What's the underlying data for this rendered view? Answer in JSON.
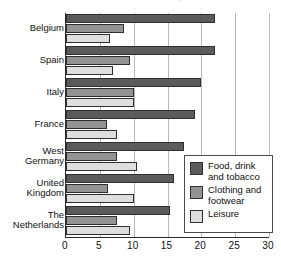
{
  "chart_data": {
    "type": "bar",
    "orientation": "horizontal",
    "title": "% of household budget",
    "xlabel": "",
    "ylabel": "",
    "xlim": [
      0,
      30
    ],
    "xticks": [
      "0",
      "5",
      "10",
      "15",
      "20",
      "25",
      "30"
    ],
    "grid": true,
    "legend_position": "bottom-right",
    "categories": [
      "Belgium",
      "Spain",
      "Italy",
      "France",
      "West Germany",
      "United Kingdom",
      "The Netherlands"
    ],
    "category_lines": [
      [
        "Belgium"
      ],
      [
        "Spain"
      ],
      [
        "Italy"
      ],
      [
        "France"
      ],
      [
        "West",
        "Germany"
      ],
      [
        "United",
        "Kingdom"
      ],
      [
        "The",
        "Netherlands"
      ]
    ],
    "series": [
      {
        "name": "Food, drink and tobacco",
        "name_lines": [
          "Food, drink",
          "and tobacco"
        ],
        "color": "#5b5b5b",
        "values": [
          22,
          22,
          20,
          19,
          17.5,
          16,
          15.4
        ]
      },
      {
        "name": "Clothing and footwear",
        "name_lines": [
          "Clothing and",
          "footwear"
        ],
        "color": "#939393",
        "values": [
          8.5,
          9.5,
          10,
          6,
          7.5,
          6.2,
          7.5
        ]
      },
      {
        "name": "Leisure",
        "name_lines": [
          "Leisure"
        ],
        "color": "#dedede",
        "values": [
          6.5,
          7,
          10,
          7.5,
          10.5,
          10,
          9.5
        ]
      }
    ]
  }
}
